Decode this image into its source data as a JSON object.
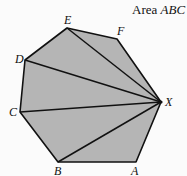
{
  "caption": {
    "prefix": "Area ",
    "italic": "ABC"
  },
  "polygon": {
    "fill": "#b5b5b5",
    "stroke": "#111111",
    "vertices": [
      {
        "name": "E",
        "x": 67,
        "y": 28
      },
      {
        "name": "F",
        "x": 117,
        "y": 39
      },
      {
        "name": "X",
        "x": 161,
        "y": 102
      },
      {
        "name": "A",
        "x": 136,
        "y": 162
      },
      {
        "name": "B",
        "x": 58,
        "y": 162
      },
      {
        "name": "C",
        "x": 20,
        "y": 112
      },
      {
        "name": "D",
        "x": 25,
        "y": 60
      }
    ]
  },
  "labels": {
    "E": "E",
    "F": "F",
    "X": "X",
    "A": "A",
    "B": "B",
    "C": "C",
    "D": "D"
  },
  "diagonals_from": "X",
  "diagonals_to": [
    "E",
    "D",
    "C",
    "B"
  ]
}
